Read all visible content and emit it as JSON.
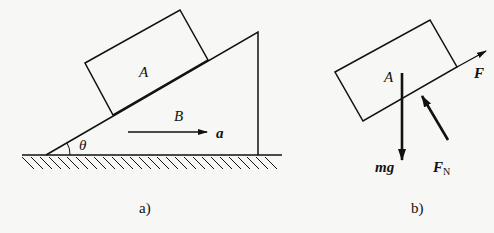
{
  "figure_a": {
    "caption": "a)",
    "block_label": "A",
    "wedge_label": "B",
    "angle_label": "θ",
    "acceleration_label": "a"
  },
  "figure_b": {
    "caption": "b)",
    "block_label": "A",
    "force_labels": {
      "applied": "F",
      "gravity": "mg",
      "normal_main": "F",
      "normal_sub": "N"
    }
  }
}
